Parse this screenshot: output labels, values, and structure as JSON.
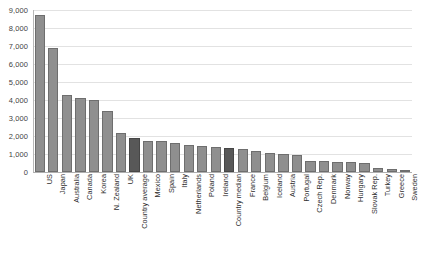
{
  "chart_data": {
    "type": "bar",
    "title": "",
    "xlabel": "",
    "ylabel": "",
    "ylim": [
      0,
      9000
    ],
    "ytick_step": 1000,
    "grid": true,
    "legend": "none",
    "yticks": [
      "0",
      "1,000",
      "2,000",
      "3,000",
      "4,000",
      "5,000",
      "6,000",
      "7,000",
      "8,000",
      "9,000"
    ],
    "categories": [
      "US",
      "Japan",
      "Australia",
      "Canada",
      "Korea",
      "N. Zealand",
      "UK",
      "Country average",
      "Mexico",
      "Spain",
      "Italy",
      "Netherlands",
      "Poland",
      "Ireland",
      "Country median",
      "France",
      "Belgium",
      "Iceland",
      "Austria",
      "Portugal",
      "Czech Rep.",
      "Denmark",
      "Norway",
      "Hungary",
      "Slovak Rep.",
      "Turkey",
      "Greece",
      "Sweden"
    ],
    "values": [
      8700,
      6900,
      4300,
      4100,
      4000,
      3400,
      2150,
      1900,
      1750,
      1700,
      1620,
      1480,
      1450,
      1400,
      1350,
      1300,
      1150,
      1050,
      1000,
      950,
      620,
      600,
      580,
      560,
      520,
      250,
      150,
      30
    ],
    "highlighted": [
      "Country average",
      "Country median"
    ],
    "colors": {
      "bar": "#8f8f8f",
      "bar_border": "#6e6e6e",
      "bar_highlight": "#585858",
      "bar_highlight_border": "#464646",
      "gridline": "#e2e2e2",
      "axis": "#b8b8b8",
      "text": "#2e2e2e",
      "background": "#ffffff"
    }
  }
}
